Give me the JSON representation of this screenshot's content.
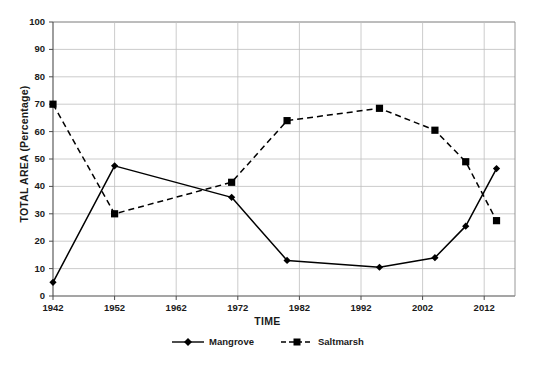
{
  "chart_data": {
    "type": "line",
    "title": "",
    "xlabel": "TIME",
    "ylabel": "TOTAL AREA (Percentage)",
    "xlim": [
      1942,
      2017
    ],
    "ylim": [
      0,
      100
    ],
    "ytick_labels": [
      "0",
      "10",
      "20",
      "30",
      "40",
      "50",
      "60",
      "70",
      "80",
      "90",
      "100"
    ],
    "ytick_values": [
      0,
      10,
      20,
      30,
      40,
      50,
      60,
      70,
      80,
      90,
      100
    ],
    "xtick_labels": [
      "1942",
      "1952",
      "1962",
      "1972",
      "1982",
      "1992",
      "2002",
      "2012"
    ],
    "xtick_values": [
      1942,
      1952,
      1962,
      1972,
      1982,
      1992,
      2002,
      2012
    ],
    "grid": true,
    "grid_color": "#bfbfbf",
    "legend_position": "bottom-center",
    "x": [
      1942,
      1952,
      1971,
      1980,
      1995,
      2004,
      2009,
      2014
    ],
    "series": [
      {
        "name": "Mangrove",
        "marker": "diamond",
        "linestyle": "solid",
        "color": "#000000",
        "values": [
          5,
          47.5,
          36,
          13,
          10.5,
          14,
          25.5,
          46.5
        ]
      },
      {
        "name": "Saltmarsh",
        "marker": "square",
        "linestyle": "dashed",
        "color": "#000000",
        "values": [
          70,
          30,
          41.5,
          64,
          68.5,
          60.5,
          49,
          27.5
        ]
      }
    ]
  },
  "axis": {
    "y_title": "TOTAL AREA (Percentage)",
    "x_title": "TIME"
  },
  "legend": {
    "entries": [
      {
        "label": "Mangrove"
      },
      {
        "label": "Saltmarsh"
      }
    ]
  }
}
